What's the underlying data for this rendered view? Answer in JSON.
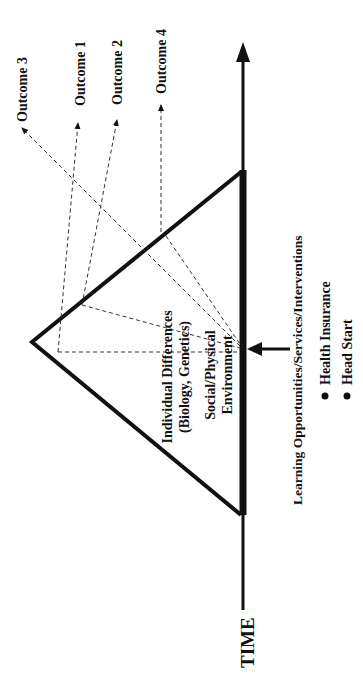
{
  "diagram": {
    "axis_label": "TIME",
    "outcomes": [
      {
        "label": "Outcome 3"
      },
      {
        "label": "Outcome 1"
      },
      {
        "label": "Outcome 2"
      },
      {
        "label": "Outcome 4"
      }
    ],
    "inner_labels": {
      "individual_line1": "Individual Differences",
      "individual_line2": "(Biology, Genetics)",
      "social_line1": "Social/Physical",
      "social_line2": "Environment"
    },
    "intervention": {
      "title": "Learning Opportunities/Services/Interventions",
      "bullets": [
        "Health Insurance",
        "Head Start"
      ]
    },
    "colors": {
      "ink": "#111111",
      "background": "#ffffff"
    }
  }
}
